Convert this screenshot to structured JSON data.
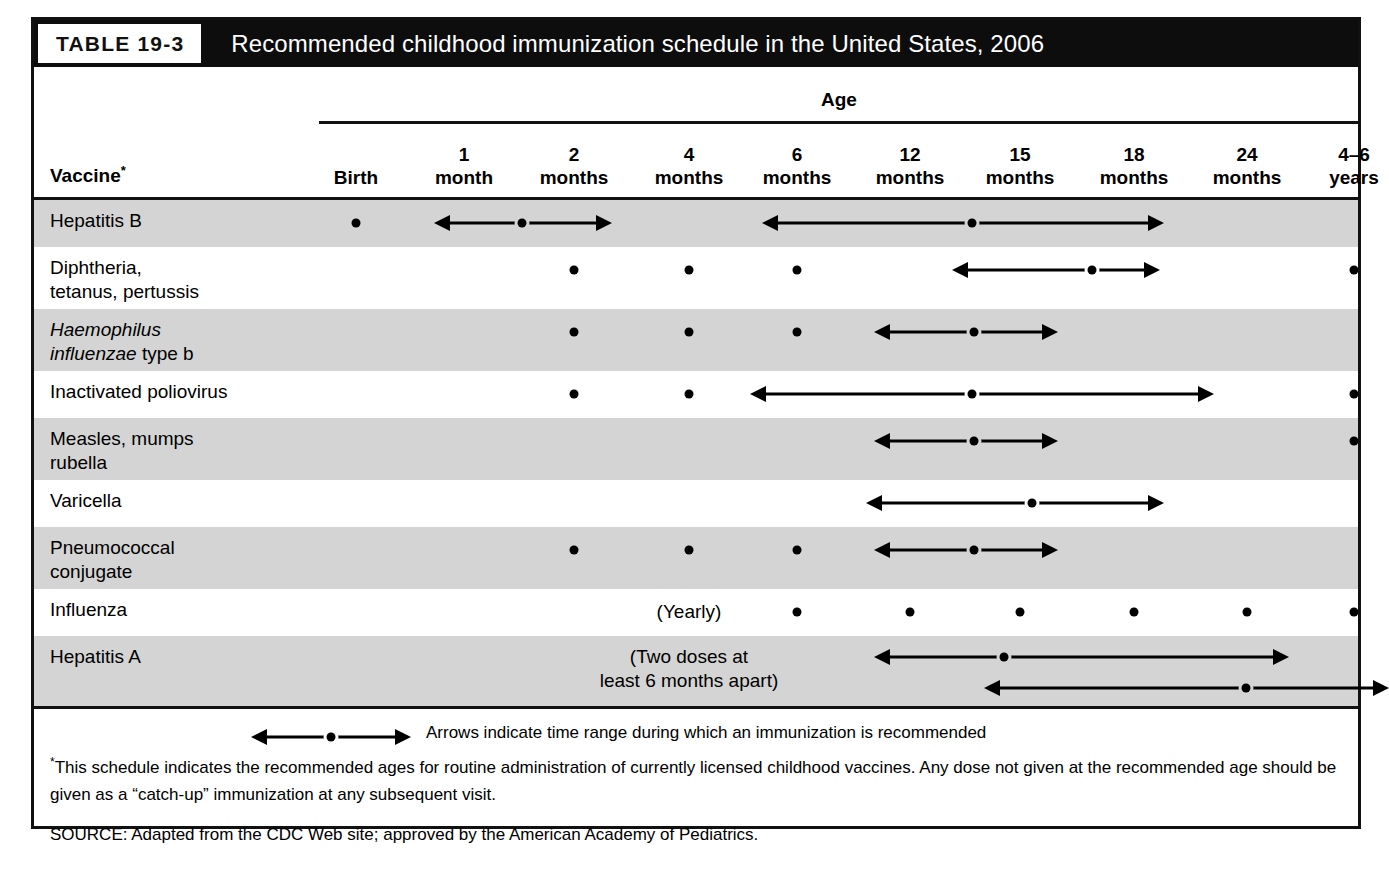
{
  "figure": {
    "table_number": "TABLE 19-3",
    "title": "Recommended childhood immunization schedule in the United States, 2006"
  },
  "header": {
    "age_group_label": "Age",
    "vaccine_column_label": "Vaccine",
    "vaccine_column_marker": "*",
    "age_columns": [
      {
        "key": "birth",
        "label": "Birth",
        "center_x": 322
      },
      {
        "key": "m1",
        "label": "1\nmonth",
        "center_x": 430
      },
      {
        "key": "m2",
        "label": "2\nmonths",
        "center_x": 540
      },
      {
        "key": "m4",
        "label": "4\nmonths",
        "center_x": 655
      },
      {
        "key": "m6",
        "label": "6\nmonths",
        "center_x": 763
      },
      {
        "key": "m12",
        "label": "12\nmonths",
        "center_x": 876
      },
      {
        "key": "m15",
        "label": "15\nmonths",
        "center_x": 986
      },
      {
        "key": "m18",
        "label": "18\nmonths",
        "center_x": 1100
      },
      {
        "key": "m24",
        "label": "24\nmonths",
        "center_x": 1213
      },
      {
        "key": "y4_6",
        "label": "4–6\nyears",
        "center_x": 1320
      }
    ]
  },
  "rows": [
    {
      "name": "Hepatitis B",
      "label": "Hepatitis B",
      "italic_prefix": "",
      "shaded": true,
      "height": 47,
      "dots": [
        322
      ],
      "arrows": [
        {
          "x1": 400,
          "x2": 578,
          "dot_x": 488
        },
        {
          "x1": 728,
          "x2": 1130,
          "dot_x": 938
        }
      ],
      "notes": []
    },
    {
      "name": "Diphtheria, tetanus, pertussis",
      "label": "Diphtheria,\ntetanus, pertussis",
      "italic_prefix": "",
      "shaded": false,
      "height": 62,
      "dots": [
        540,
        655,
        763,
        1320
      ],
      "arrows": [
        {
          "x1": 918,
          "x2": 1126,
          "dot_x": 1058
        }
      ],
      "notes": []
    },
    {
      "name": "Haemophilus influenzae type b",
      "label": " type b",
      "italic_prefix": "Haemophilus\ninfluenzae",
      "shaded": true,
      "height": 62,
      "dots": [
        540,
        655,
        763
      ],
      "arrows": [
        {
          "x1": 840,
          "x2": 1024,
          "dot_x": 940
        }
      ],
      "notes": []
    },
    {
      "name": "Inactivated poliovirus",
      "label": "Inactivated poliovirus",
      "italic_prefix": "",
      "shaded": false,
      "height": 47,
      "dots": [
        540,
        655,
        1320
      ],
      "arrows": [
        {
          "x1": 716,
          "x2": 1180,
          "dot_x": 938
        }
      ],
      "notes": []
    },
    {
      "name": "Measles, mumps, rubella",
      "label": "Measles, mumps\nrubella",
      "italic_prefix": "",
      "shaded": true,
      "height": 62,
      "dots": [
        1320
      ],
      "arrows": [
        {
          "x1": 840,
          "x2": 1024,
          "dot_x": 940
        }
      ],
      "notes": []
    },
    {
      "name": "Varicella",
      "label": "Varicella",
      "italic_prefix": "",
      "shaded": false,
      "height": 47,
      "dots": [],
      "arrows": [
        {
          "x1": 832,
          "x2": 1130,
          "dot_x": 998
        }
      ],
      "notes": []
    },
    {
      "name": "Pneumococcal conjugate",
      "label": "Pneumococcal\nconjugate",
      "italic_prefix": "",
      "shaded": true,
      "height": 62,
      "dots": [
        540,
        655,
        763
      ],
      "arrows": [
        {
          "x1": 840,
          "x2": 1024,
          "dot_x": 940
        }
      ],
      "notes": []
    },
    {
      "name": "Influenza",
      "label": "Influenza",
      "italic_prefix": "",
      "shaded": false,
      "height": 47,
      "dots": [
        763,
        876,
        986,
        1100,
        1213,
        1320
      ],
      "arrows": [],
      "notes": [
        {
          "text": "(Yearly)",
          "center_x": 655,
          "top": 11
        }
      ]
    },
    {
      "name": "Hepatitis A",
      "label": "Hepatitis A",
      "italic_prefix": "",
      "shaded": true,
      "height": 70,
      "dots": [],
      "arrows": [
        {
          "x1": 840,
          "x2": 1255,
          "dot_x": 970,
          "top": 21
        },
        {
          "x1": 950,
          "x2": 1355,
          "dot_x": 1212,
          "top": 52
        }
      ],
      "notes": [
        {
          "text": "(Two doses at\nleast 6 months apart)",
          "center_x": 655,
          "top": 9
        }
      ]
    }
  ],
  "footer": {
    "legend_text": "Arrows indicate time range during which an immunization is recommended",
    "note_marker": "*",
    "note_text": "This schedule indicates the recommended ages for routine administration of currently licensed childhood vaccines. Any dose not given at the recommended age should be given as a “catch-up” immunization at any subsequent visit.",
    "source_text": "SOURCE: Adapted from the CDC Web site; approved by the American Academy of Pediatrics."
  },
  "colors": {
    "title_bar": "#0d0d0d",
    "row_shaded": "#d4d4d4",
    "row_plain": "#ffffff",
    "rule": "#111111"
  }
}
